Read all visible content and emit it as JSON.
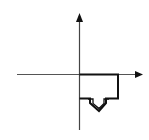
{
  "diagram": {
    "type": "coordinate-axes-with-shape",
    "background": "#ffffff",
    "stroke_color": "#111111",
    "axes": {
      "x_axis": {
        "direction": "right",
        "arrowhead": true
      },
      "y_axis": {
        "direction": "up",
        "arrowhead": true
      }
    },
    "shape": {
      "name": "rectangle-with-down-arrow",
      "quadrant": "IV",
      "description": "Rectangle anchored at origin extending right and down, with a hollow downward-pointing arrow below it"
    },
    "labels": []
  }
}
